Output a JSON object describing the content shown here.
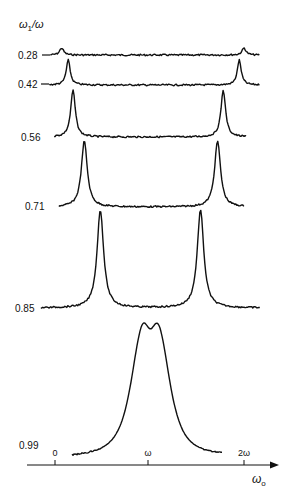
{
  "chart_data": {
    "type": "line",
    "title": "",
    "ylabel": "ω1/ω",
    "xlabel": "ω0",
    "x_ticks": [
      "0",
      "ω",
      "2ω"
    ],
    "x_tick_values": [
      0,
      1,
      2
    ],
    "xlim": [
      -0.3,
      2.4
    ],
    "grid": false,
    "legend": "none",
    "layout": "stacked spectra (waterfall), each trace offset vertically and labeled at left with ω1/ω value",
    "series": [
      {
        "name": "0.28",
        "peaks_x": [
          0.07,
          2.0
        ],
        "peak_height_rel": 0.07,
        "x_range": [
          -0.05,
          2.17
        ]
      },
      {
        "name": "0.42",
        "peaks_x": [
          0.14,
          1.95
        ],
        "peak_height_rel": 0.25,
        "x_range": [
          -0.06,
          2.17
        ]
      },
      {
        "name": "0.56",
        "peaks_x": [
          0.19,
          1.78
        ],
        "peak_height_rel": 0.47,
        "x_range": [
          -0.01,
          2.03
        ]
      },
      {
        "name": "0.71",
        "peaks_x": [
          0.31,
          1.72
        ],
        "peak_height_rel": 0.66,
        "x_range": [
          0.04,
          2.0
        ]
      },
      {
        "name": "0.85",
        "peaks_x": [
          0.48,
          1.54
        ],
        "peak_height_rel": 0.98,
        "x_range": [
          -0.15,
          2.17
        ]
      },
      {
        "name": "0.99",
        "peaks_x": [
          0.89,
          1.13
        ],
        "peak_height_rel": 1.4,
        "x_range": [
          0.18,
          1.77
        ],
        "note": "two peaks merged into a broad doublet centered at ω"
      }
    ]
  },
  "labels": {
    "y_axis_title": "ω",
    "y_axis_sub": "1",
    "y_axis_rest": "/ω",
    "x_axis_title": "ω",
    "x_axis_sub": "o",
    "ticks": [
      "0",
      "ω",
      "2ω"
    ],
    "traces": [
      "0.28",
      "0.42",
      "0.56",
      "0.71",
      "0.85",
      "0.99"
    ]
  },
  "colors": {
    "ink": "#111111",
    "background": "#ffffff"
  }
}
